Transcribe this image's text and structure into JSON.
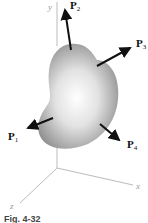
{
  "figure": {
    "caption": "Fig. 4-32",
    "axes": {
      "x": "x",
      "y": "y",
      "z": "z"
    },
    "forces": [
      {
        "name": "P",
        "sub": "1"
      },
      {
        "name": "P",
        "sub": "2"
      },
      {
        "name": "P",
        "sub": "3"
      },
      {
        "name": "P",
        "sub": "4"
      }
    ],
    "colors": {
      "arrow": "#111111",
      "axis": "#aaaaaa",
      "body_light": "#ffffff",
      "body_dark": "#8a8a8a"
    }
  }
}
